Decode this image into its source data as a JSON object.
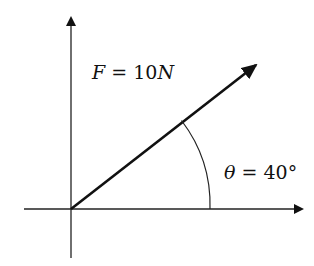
{
  "diagram": {
    "type": "force-vector",
    "origin": [
      71,
      209
    ],
    "x_axis": {
      "from": [
        24,
        209
      ],
      "to": [
        304,
        209
      ]
    },
    "y_axis": {
      "from": [
        71,
        258
      ],
      "to": [
        71,
        16
      ]
    },
    "vector": {
      "from": [
        71,
        209
      ],
      "to": [
        257,
        64
      ],
      "magnitude_label": "F = 10N",
      "angle_deg": 40
    },
    "angle_arc": {
      "radius": 139,
      "start_deg": 0,
      "end_deg": 40
    }
  },
  "labels": {
    "force": {
      "var": "F",
      "eq": " = ",
      "value": "10",
      "unit": "N"
    },
    "angle": {
      "var": "θ",
      "eq": " = ",
      "value": "40°"
    }
  },
  "colors": {
    "stroke": "#111111",
    "background": "#ffffff"
  }
}
